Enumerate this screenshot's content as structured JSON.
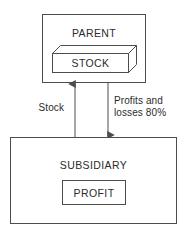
{
  "diagram": {
    "type": "block-flow",
    "background_color": "#ffffff",
    "stroke_color": "#4d4d4d",
    "text_color": "#2b2b2b",
    "nodes": [
      {
        "id": "parent",
        "label": "PARENT",
        "shape": "rectangle",
        "x": 42,
        "y": 14,
        "width": 103,
        "height": 68
      },
      {
        "id": "stock",
        "label": "STOCK",
        "shape": "cuboid-3d",
        "parent": "parent",
        "x": 52,
        "y": 53,
        "width": 76,
        "height": 19,
        "depth": 8
      },
      {
        "id": "subsidiary",
        "label": "SUBSIDIARY",
        "shape": "rectangle",
        "x": 10,
        "y": 137,
        "width": 166,
        "height": 86
      },
      {
        "id": "profit",
        "label": "PROFIT",
        "shape": "rectangle",
        "parent": "subsidiary",
        "x": 62,
        "y": 180,
        "width": 63,
        "height": 24
      }
    ],
    "edges": [
      {
        "id": "stock-edge",
        "label": "Stock",
        "from": "subsidiary",
        "to": "parent",
        "direction": "up",
        "arrowhead": "end",
        "x": 75,
        "y_start": 137,
        "y_end": 83,
        "label_x": 38,
        "label_y": 108
      },
      {
        "id": "profits-losses-edge",
        "label_line1": "Profits and",
        "label_line2": "losses 80%",
        "from": "parent",
        "to": "subsidiary",
        "direction": "down",
        "arrowhead": "end",
        "x": 108,
        "y_start": 82,
        "y_end": 136,
        "label_x": 114,
        "label_y": 102
      }
    ]
  }
}
